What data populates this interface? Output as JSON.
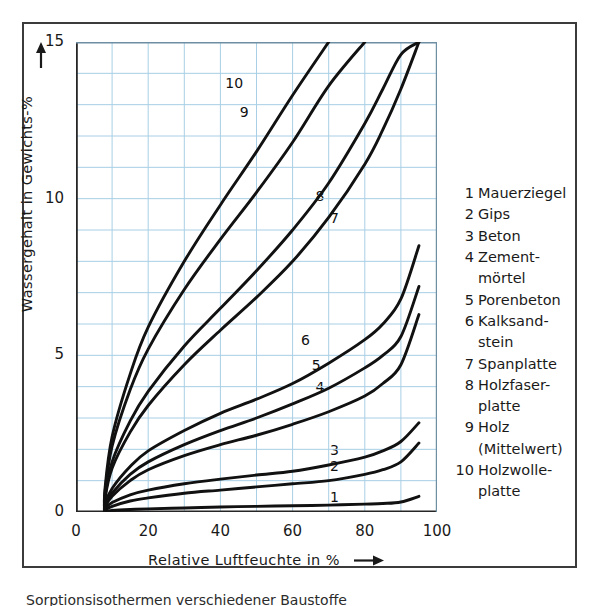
{
  "figure": {
    "background": "#ffffff",
    "frame_color": "#3b3b3b",
    "grid_color": "#a8cfe5",
    "curve_color": "#111111"
  },
  "axes": {
    "y_title": "Wassergehalt in Gewichts-%",
    "x_title": "Relative Luftfeuchte in %",
    "y_ticks": [
      "0",
      "5",
      "10",
      "15"
    ],
    "x_ticks": [
      "0",
      "20",
      "40",
      "60",
      "80",
      "100"
    ],
    "y_arrow_icon": "up-arrow-icon",
    "x_arrow_icon": "right-arrow-icon"
  },
  "legend": {
    "items": [
      {
        "num": "1",
        "lines": [
          "Mauerziegel"
        ]
      },
      {
        "num": "2",
        "lines": [
          "Gips"
        ]
      },
      {
        "num": "3",
        "lines": [
          "Beton"
        ]
      },
      {
        "num": "4",
        "lines": [
          "Zement-",
          "mörtel"
        ]
      },
      {
        "num": "5",
        "lines": [
          "Porenbeton"
        ]
      },
      {
        "num": "6",
        "lines": [
          "Kalksand-",
          "stein"
        ]
      },
      {
        "num": "7",
        "lines": [
          "Spanplatte"
        ]
      },
      {
        "num": "8",
        "lines": [
          "Holzfaser-",
          "platte"
        ]
      },
      {
        "num": "9",
        "lines": [
          "Holz",
          "(Mittelwert)"
        ]
      },
      {
        "num": "10",
        "lines": [
          "Holzwolle-",
          "platte"
        ]
      }
    ]
  },
  "caption": "Sorptionsisothermen verschiedener Baustoffe",
  "chart_data": {
    "type": "line",
    "title": "",
    "xlabel": "Relative Luftfeuchte in %",
    "ylabel": "Wassergehalt in Gewichts-%",
    "xlim": [
      0,
      100
    ],
    "ylim": [
      0,
      15
    ],
    "xticks": [
      0,
      20,
      40,
      60,
      80,
      100
    ],
    "yticks": [
      0,
      5,
      10,
      15
    ],
    "grid": true,
    "grid_major_x": 10,
    "grid_major_y": 1,
    "legend_position": "right-outside",
    "x": [
      8,
      10,
      15,
      20,
      30,
      40,
      50,
      60,
      70,
      80,
      85,
      90,
      95
    ],
    "series": [
      {
        "name": "Mauerziegel",
        "num": 1,
        "label_x": 72,
        "label_y": 0.45,
        "values": [
          0.02,
          0.05,
          0.08,
          0.1,
          0.13,
          0.16,
          0.18,
          0.2,
          0.22,
          0.25,
          0.27,
          0.32,
          0.5
        ]
      },
      {
        "name": "Gips",
        "num": 2,
        "label_x": 72,
        "label_y": 1.45,
        "values": [
          0.05,
          0.18,
          0.35,
          0.45,
          0.6,
          0.7,
          0.8,
          0.9,
          1.0,
          1.2,
          1.35,
          1.6,
          2.2
        ]
      },
      {
        "name": "Beton",
        "num": 3,
        "label_x": 72,
        "label_y": 1.95,
        "values": [
          0.1,
          0.3,
          0.55,
          0.7,
          0.9,
          1.05,
          1.18,
          1.3,
          1.5,
          1.75,
          1.95,
          2.25,
          2.85
        ]
      },
      {
        "name": "Zementmörtel",
        "num": 4,
        "label_x": 68,
        "label_y": 3.95,
        "values": [
          0.15,
          0.5,
          1.0,
          1.35,
          1.8,
          2.15,
          2.45,
          2.8,
          3.2,
          3.7,
          4.1,
          4.7,
          6.3
        ]
      },
      {
        "name": "Porenbeton",
        "num": 5,
        "label_x": 67,
        "label_y": 4.65,
        "values": [
          0.2,
          0.6,
          1.2,
          1.6,
          2.15,
          2.6,
          3.0,
          3.45,
          3.95,
          4.6,
          5.0,
          5.6,
          7.2
        ]
      },
      {
        "name": "Kalksandstein",
        "num": 6,
        "label_x": 64,
        "label_y": 5.45,
        "values": [
          0.25,
          0.75,
          1.45,
          1.95,
          2.6,
          3.15,
          3.6,
          4.1,
          4.75,
          5.5,
          6.0,
          6.8,
          8.5
        ]
      },
      {
        "name": "Spanplatte",
        "num": 7,
        "label_x": 72,
        "label_y": 9.35,
        "values": [
          0.4,
          1.4,
          2.55,
          3.4,
          4.7,
          5.8,
          6.85,
          8.0,
          9.4,
          11.1,
          12.2,
          13.5,
          15.0
        ]
      },
      {
        "name": "Holzfaserplatte",
        "num": 8,
        "label_x": 68,
        "label_y": 10.05,
        "values": [
          0.45,
          1.6,
          2.9,
          3.85,
          5.3,
          6.5,
          7.7,
          9.0,
          10.5,
          12.4,
          13.5,
          14.6,
          15.0
        ]
      },
      {
        "name": "Holz (Mittelwert)",
        "num": 9,
        "label_x": 47,
        "label_y": 12.75,
        "values": [
          0.6,
          2.1,
          3.9,
          5.2,
          7.1,
          8.7,
          10.2,
          11.8,
          13.6,
          15.0,
          15.0,
          15.0,
          15.0
        ]
      },
      {
        "name": "Holzwolleplatte",
        "num": 10,
        "label_x": 43,
        "label_y": 13.65,
        "values": [
          0.7,
          2.4,
          4.4,
          5.9,
          8.0,
          9.8,
          11.5,
          13.3,
          15.0,
          15.0,
          15.0,
          15.0,
          15.0
        ]
      }
    ]
  }
}
